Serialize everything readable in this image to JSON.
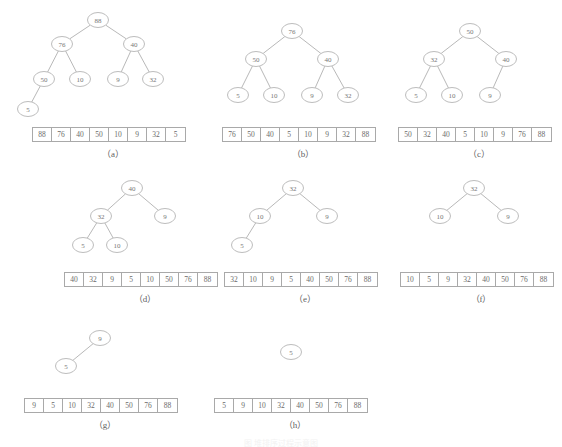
{
  "figure": {
    "caption": "图 堆排序过程示意图",
    "panels": [
      {
        "id": "a",
        "label": "（a）",
        "nodes": [
          {
            "value": "88",
            "x": 98,
            "y": 20
          },
          {
            "value": "76",
            "x": 62,
            "y": 44
          },
          {
            "value": "40",
            "x": 134,
            "y": 44
          },
          {
            "value": "50",
            "x": 44,
            "y": 79
          },
          {
            "value": "10",
            "x": 80,
            "y": 79
          },
          {
            "value": "9",
            "x": 118,
            "y": 79
          },
          {
            "value": "32",
            "x": 153,
            "y": 79
          },
          {
            "value": "5",
            "x": 28,
            "y": 109
          }
        ],
        "edges": [
          [
            0,
            1
          ],
          [
            0,
            2
          ],
          [
            1,
            3
          ],
          [
            1,
            4
          ],
          [
            2,
            5
          ],
          [
            2,
            6
          ],
          [
            3,
            7
          ]
        ],
        "array": [
          "88",
          "76",
          "40",
          "50",
          "10",
          "9",
          "32",
          "5"
        ],
        "array_x": 32,
        "array_y": 127,
        "label_x": 32,
        "label_y": 147,
        "label_w": 162
      },
      {
        "id": "b",
        "label": "（b）",
        "nodes": [
          {
            "value": "76",
            "x": 292,
            "y": 31
          },
          {
            "value": "50",
            "x": 256,
            "y": 59
          },
          {
            "value": "40",
            "x": 328,
            "y": 59
          },
          {
            "value": "5",
            "x": 238,
            "y": 95
          },
          {
            "value": "10",
            "x": 274,
            "y": 95
          },
          {
            "value": "9",
            "x": 312,
            "y": 95
          },
          {
            "value": "32",
            "x": 348,
            "y": 95
          }
        ],
        "edges": [
          [
            0,
            1
          ],
          [
            0,
            2
          ],
          [
            1,
            3
          ],
          [
            1,
            4
          ],
          [
            2,
            5
          ],
          [
            2,
            6
          ]
        ],
        "array": [
          "76",
          "50",
          "40",
          "5",
          "10",
          "9",
          "32",
          "88"
        ],
        "array_x": 222,
        "array_y": 127,
        "label_x": 222,
        "label_y": 147,
        "label_w": 162
      },
      {
        "id": "c",
        "label": "（c）",
        "nodes": [
          {
            "value": "50",
            "x": 470,
            "y": 31
          },
          {
            "value": "32",
            "x": 434,
            "y": 59
          },
          {
            "value": "40",
            "x": 506,
            "y": 59
          },
          {
            "value": "5",
            "x": 416,
            "y": 95
          },
          {
            "value": "10",
            "x": 452,
            "y": 95
          },
          {
            "value": "9",
            "x": 490,
            "y": 95
          }
        ],
        "edges": [
          [
            0,
            1
          ],
          [
            0,
            2
          ],
          [
            1,
            3
          ],
          [
            1,
            4
          ],
          [
            2,
            5
          ]
        ],
        "array": [
          "50",
          "32",
          "40",
          "5",
          "10",
          "9",
          "76",
          "88"
        ],
        "array_x": 398,
        "array_y": 127,
        "label_x": 398,
        "label_y": 147,
        "label_w": 162
      },
      {
        "id": "d",
        "label": "（d）",
        "nodes": [
          {
            "value": "40",
            "x": 132,
            "y": 188
          },
          {
            "value": "32",
            "x": 101,
            "y": 216
          },
          {
            "value": "9",
            "x": 165,
            "y": 216
          },
          {
            "value": "5",
            "x": 83,
            "y": 245
          },
          {
            "value": "10",
            "x": 117,
            "y": 245
          }
        ],
        "edges": [
          [
            0,
            1
          ],
          [
            0,
            2
          ],
          [
            1,
            3
          ],
          [
            1,
            4
          ]
        ],
        "array": [
          "40",
          "32",
          "9",
          "5",
          "10",
          "50",
          "76",
          "88"
        ],
        "array_x": 64,
        "array_y": 272,
        "label_x": 64,
        "label_y": 292,
        "label_w": 162
      },
      {
        "id": "e",
        "label": "（e）",
        "nodes": [
          {
            "value": "32",
            "x": 293,
            "y": 188
          },
          {
            "value": "10",
            "x": 260,
            "y": 216
          },
          {
            "value": "9",
            "x": 327,
            "y": 216
          },
          {
            "value": "5",
            "x": 242,
            "y": 245
          }
        ],
        "edges": [
          [
            0,
            1
          ],
          [
            0,
            2
          ],
          [
            1,
            3
          ]
        ],
        "array": [
          "32",
          "10",
          "9",
          "5",
          "40",
          "50",
          "76",
          "88"
        ],
        "array_x": 224,
        "array_y": 272,
        "label_x": 224,
        "label_y": 292,
        "label_w": 162
      },
      {
        "id": "f",
        "label": "（f）",
        "nodes": [
          {
            "value": "32",
            "x": 474,
            "y": 188
          },
          {
            "value": "10",
            "x": 440,
            "y": 216
          },
          {
            "value": "9",
            "x": 508,
            "y": 216
          }
        ],
        "edges": [
          [
            0,
            1
          ],
          [
            0,
            2
          ]
        ],
        "array": [
          "10",
          "5",
          "9",
          "32",
          "40",
          "50",
          "76",
          "88"
        ],
        "array_x": 400,
        "array_y": 272,
        "label_x": 400,
        "label_y": 292,
        "label_w": 162
      },
      {
        "id": "g",
        "label": "（g）",
        "nodes": [
          {
            "value": "9",
            "x": 100,
            "y": 338
          },
          {
            "value": "5",
            "x": 66,
            "y": 366
          }
        ],
        "edges": [
          [
            0,
            1
          ]
        ],
        "array": [
          "9",
          "5",
          "10",
          "32",
          "40",
          "50",
          "76",
          "88"
        ],
        "array_x": 24,
        "array_y": 398,
        "label_x": 24,
        "label_y": 418,
        "label_w": 162
      },
      {
        "id": "h",
        "label": "（h）",
        "nodes": [
          {
            "value": "5",
            "x": 291,
            "y": 352
          }
        ],
        "edges": [],
        "array": [
          "5",
          "9",
          "10",
          "32",
          "40",
          "50",
          "76",
          "88"
        ],
        "array_x": 214,
        "array_y": 398,
        "label_x": 214,
        "label_y": 418,
        "label_w": 162
      }
    ]
  },
  "style": {
    "line_color": "#b0b0b0",
    "node_stroke": "#b4b4b4",
    "text_color": "#6f6f6f",
    "cell_border": "#a9a9a9",
    "background": "#ffffff"
  }
}
